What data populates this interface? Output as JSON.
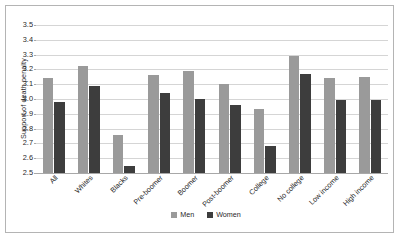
{
  "chart_data": {
    "type": "bar",
    "title": "",
    "xlabel": "",
    "ylabel": "Support of death penalty",
    "ylim": [
      2.5,
      3.5
    ],
    "ytick_step": 0.1,
    "yticks": [
      "3.5",
      "3.4",
      "3.3",
      "3.2",
      "3.1",
      "3.0",
      "2.9",
      "2.8",
      "2.7",
      "2.6",
      "2.5"
    ],
    "grid": true,
    "legend_position": "bottom-center",
    "categories": [
      "All",
      "Whites",
      "Blacks",
      "Pre-boomer",
      "Boomer",
      "Post-boomer",
      "College",
      "No college",
      "Low income",
      "High income"
    ],
    "series": [
      {
        "name": "Men",
        "color": "#9a9a9a",
        "values": [
          3.14,
          3.22,
          2.76,
          3.16,
          3.19,
          3.1,
          2.93,
          3.29,
          3.14,
          3.15
        ]
      },
      {
        "name": "Women",
        "color": "#3d3d3d",
        "values": [
          2.98,
          3.09,
          2.55,
          3.04,
          3.0,
          2.96,
          2.68,
          3.17,
          2.99,
          2.99
        ]
      }
    ]
  },
  "legend": {
    "items": [
      {
        "label": "Men"
      },
      {
        "label": "Women"
      }
    ]
  },
  "axes": {
    "y_title": "Support of death penalty"
  }
}
